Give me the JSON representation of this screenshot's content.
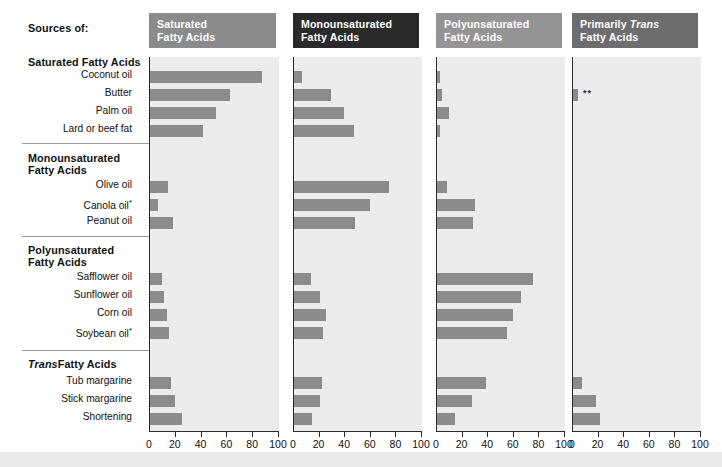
{
  "title_left": "Sources of:",
  "groups": [
    {
      "name": "Saturated Fatty Acids",
      "items": [
        "Coconut oil",
        "Butter",
        "Palm oil",
        "Lard or beef fat"
      ]
    },
    {
      "name": "Monounsaturated Fatty Acids",
      "items": [
        "Olive oil",
        "Canola oil*",
        "Peanut oil"
      ]
    },
    {
      "name": "Polyunsaturated Fatty Acids",
      "items": [
        "Safflower oil",
        "Sunflower oil",
        "Corn oil",
        "Soybean oil*"
      ]
    },
    {
      "name": "Trans Fatty Acids",
      "name_italic_prefix": "Trans",
      "name_rest": " Fatty Acids",
      "items": [
        "Tub margarine",
        "Stick margarine",
        "Shortening"
      ]
    }
  ],
  "labels": {
    "g0_head": "Saturated Fatty Acids",
    "g1_head_l1": "Monounsaturated",
    "g1_head_l2": "Fatty Acids",
    "g2_head_l1": "Polyunsaturated",
    "g2_head_l2": "Fatty Acids",
    "g3_head_ital": "Trans",
    "g3_head_rest": "Fatty Acids",
    "i0": "Coconut oil",
    "i1": "Butter",
    "i2": "Palm oil",
    "i3": "Lard or beef fat",
    "i4": "Olive oil",
    "i5": "Canola oil",
    "i6": "Peanut oil",
    "i7": "Safflower oil",
    "i8": "Sunflower oil",
    "i9": "Corn oil",
    "i10": "Soybean oil",
    "i11": "Tub margarine",
    "i12": "Stick margarine",
    "i13": "Shortening",
    "asterisk": "*",
    "double_asterisk": "**"
  },
  "columns": [
    {
      "id": "saturated",
      "title_l1": "Saturated",
      "title_l2": "Fatty Acids",
      "header_bg": "#8b8b8b",
      "italic_word": ""
    },
    {
      "id": "monounsaturated",
      "title_l1": "Monounsaturated",
      "title_l2": "Fatty Acids",
      "header_bg": "#2a2a2a",
      "italic_word": ""
    },
    {
      "id": "polyunsaturated",
      "title_l1": "Polyunsaturated",
      "title_l2": "Fatty Acids",
      "header_bg": "#949494",
      "italic_word": ""
    },
    {
      "id": "primarily_trans",
      "title_l1_pre": "Primarily ",
      "title_l1_ital": "Trans",
      "title_l2": "Fatty Acids",
      "header_bg": "#6d6d6d",
      "italic_word": "Trans"
    }
  ],
  "axis": {
    "ticks": [
      0,
      20,
      40,
      60,
      80,
      100
    ],
    "tick_labels": [
      "0",
      "20",
      "40",
      "60",
      "80",
      "100"
    ],
    "min": 0,
    "max": 100
  },
  "colors": {
    "bar": "#8b8b8b",
    "plot_bg": "#ececec",
    "axis": "#2b2b2b",
    "divider": "#9a9a9a",
    "band": "#e9e9e9"
  },
  "annotations": [
    {
      "column": "primarily_trans",
      "row": "Butter",
      "text": "**"
    }
  ],
  "chart_data": {
    "type": "bar",
    "xlabel": "",
    "ylabel": "",
    "xlim": [
      0,
      100
    ],
    "grid": false,
    "legend": "column headers",
    "categories": [
      "Coconut oil",
      "Butter",
      "Palm oil",
      "Lard or beef fat",
      "Olive oil",
      "Canola oil*",
      "Peanut oil",
      "Safflower oil",
      "Sunflower oil",
      "Corn oil",
      "Soybean oil*",
      "Tub margarine",
      "Stick margarine",
      "Shortening"
    ],
    "series": [
      {
        "name": "Saturated Fatty Acids",
        "values": [
          87,
          62,
          51,
          41,
          14,
          6,
          18,
          9,
          11,
          13,
          15,
          16,
          19,
          25
        ]
      },
      {
        "name": "Monounsaturated Fatty Acids",
        "values": [
          6,
          29,
          39,
          47,
          74,
          59,
          48,
          13,
          20,
          25,
          23,
          22,
          20,
          14
        ]
      },
      {
        "name": "Polyunsaturated Fatty Acids",
        "values": [
          2,
          4,
          9,
          2,
          8,
          30,
          28,
          75,
          66,
          59,
          55,
          38,
          27,
          14
        ]
      },
      {
        "name": "Primarily Trans Fatty Acids",
        "values": [
          0,
          4,
          0,
          0,
          0,
          0,
          0,
          0,
          0,
          0,
          0,
          7,
          18,
          21
        ]
      }
    ],
    "annotations": [
      "* Canola oil and Soybean oil marked with asterisk",
      "** Butter value in Primarily Trans column marked with double asterisk"
    ]
  }
}
